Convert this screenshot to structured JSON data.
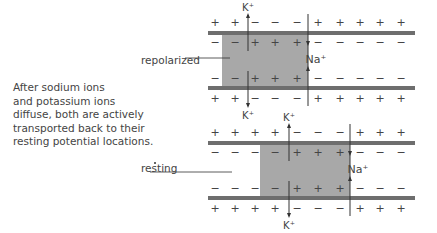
{
  "caption": [
    "After sodium ions",
    "and potassium ions",
    "diffuse, both are actively",
    "transported back to their",
    "resting potential locations."
  ],
  "labels": {
    "repolarized": "repolarized",
    "resting": "resting"
  },
  "ions": {
    "k": "K",
    "na": "Na",
    "sup": "+"
  },
  "colors": {
    "membrane": "#6e6e6e",
    "fill": "#a8a8a8",
    "line": "#333333"
  },
  "diagrams": [
    {
      "name": "repolarized",
      "top": 31,
      "bottom": 86,
      "boxX": 222,
      "boxW": 86,
      "kX": 248,
      "naX": 308,
      "outer": [
        "+",
        "+",
        "−",
        "−",
        "−",
        "+",
        "+",
        "+",
        "+",
        "+"
      ],
      "inner": [
        "−",
        "−",
        "+",
        "+",
        "+",
        "−",
        "−",
        "−",
        "−",
        "−"
      ]
    },
    {
      "name": "resting",
      "top": 141,
      "bottom": 196,
      "boxX": 260,
      "boxW": 90,
      "kX": 289,
      "naX": 350,
      "outer": [
        "+",
        "+",
        "+",
        "+",
        "−",
        "−",
        "−",
        "+",
        "+",
        "+"
      ],
      "inner": [
        "−",
        "−",
        "−",
        "−",
        "+",
        "+",
        "+",
        "−",
        "−",
        "−"
      ]
    }
  ]
}
